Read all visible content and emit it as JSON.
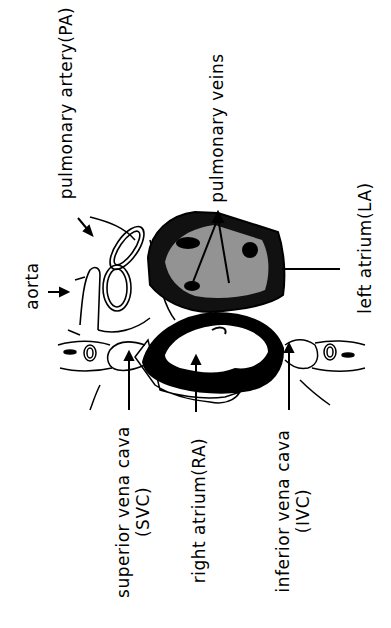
{
  "diagram": {
    "labels": {
      "pulmonary_artery": "pulmonary artery(PA)",
      "aorta": "aorta",
      "pulmonary_veins": "pulmonary veins",
      "left_atrium": "left atrium(LA)",
      "superior_vena_cava_line1": "superior vena cava",
      "superior_vena_cava_line2": "(SVC)",
      "right_atrium": "right atrium(RA)",
      "inferior_vena_cava_line1": "inferior vena cava",
      "inferior_vena_cava_line2": "(IVC)"
    },
    "colors": {
      "ink": "#000000",
      "background": "#ffffff"
    }
  }
}
